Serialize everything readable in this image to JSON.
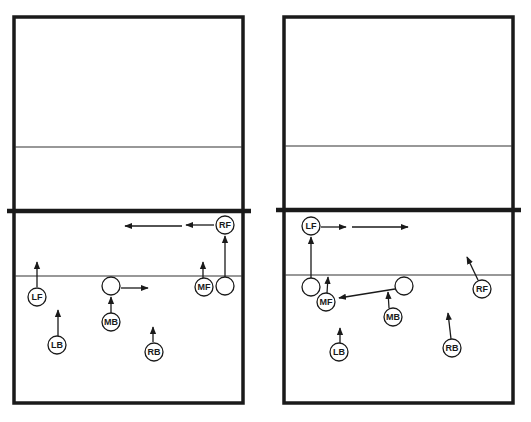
{
  "diagram": {
    "panels": [
      {
        "name": "left-court",
        "players": [
          {
            "label": "RF",
            "x": 225,
            "y": 225
          },
          {
            "label": "MF",
            "x": 203,
            "y": 287
          },
          {
            "label": "LF",
            "x": 37,
            "y": 297
          },
          {
            "label": "MB",
            "x": 111,
            "y": 322
          },
          {
            "label": "LB",
            "x": 57,
            "y": 345
          },
          {
            "label": "RB",
            "x": 154,
            "y": 352
          }
        ],
        "empty_positions": [
          {
            "x": 111,
            "y": 286
          },
          {
            "x": 225,
            "y": 286
          }
        ]
      },
      {
        "name": "right-court",
        "players": [
          {
            "label": "LF",
            "x": 311,
            "y": 226
          },
          {
            "label": "MF",
            "x": 326,
            "y": 302
          },
          {
            "label": "MB",
            "x": 393,
            "y": 317
          },
          {
            "label": "RF",
            "x": 482,
            "y": 289
          },
          {
            "label": "LB",
            "x": 339,
            "y": 352
          },
          {
            "label": "RB",
            "x": 453,
            "y": 348
          }
        ],
        "empty_positions": [
          {
            "x": 311,
            "y": 287
          },
          {
            "x": 404,
            "y": 286
          }
        ]
      }
    ]
  }
}
